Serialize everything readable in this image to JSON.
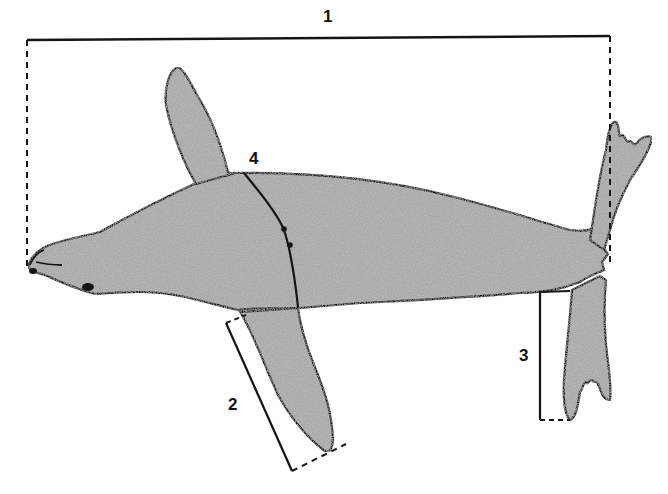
{
  "diagram": {
    "colors": {
      "body_fill": "#a9a9a9",
      "outline": "#151515",
      "background": "#ffffff"
    },
    "measurements": [
      {
        "id": "1",
        "label": "1",
        "meaning": "total body length",
        "style": "solid bracket with dashed end lines"
      },
      {
        "id": "2",
        "label": "2",
        "meaning": "fore flipper length",
        "style": "solid bracket with dashed end lines"
      },
      {
        "id": "3",
        "label": "3",
        "meaning": "hind flipper length",
        "style": "solid bracket with dashed end line"
      },
      {
        "id": "4",
        "label": "4",
        "meaning": "girth",
        "style": "curved line around body"
      }
    ]
  }
}
